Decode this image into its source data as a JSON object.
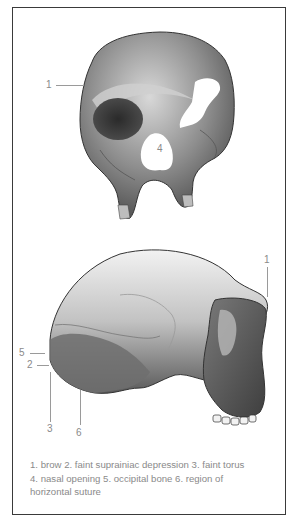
{
  "figure": {
    "front_view": {
      "labels": [
        {
          "id": "1",
          "text": "1"
        },
        {
          "id": "4",
          "text": "4"
        }
      ]
    },
    "side_view": {
      "labels": [
        {
          "id": "1",
          "text": "1"
        },
        {
          "id": "5",
          "text": "5"
        },
        {
          "id": "2",
          "text": "2"
        },
        {
          "id": "3",
          "text": "3"
        },
        {
          "id": "6",
          "text": "6"
        }
      ]
    },
    "caption": {
      "line1": "1. brow 2. faint suprainiac depression 3. faint torus",
      "line2": "4. nasal opening 5. occipital bone 6. region of",
      "line3": "horizontal suture"
    }
  },
  "colors": {
    "border": "#3a3a3a",
    "label_text": "#8a8a8a",
    "bone_dark": "#3c3c3c",
    "bone_mid": "#8c8c8c",
    "bone_light": "#e4e4e4"
  }
}
